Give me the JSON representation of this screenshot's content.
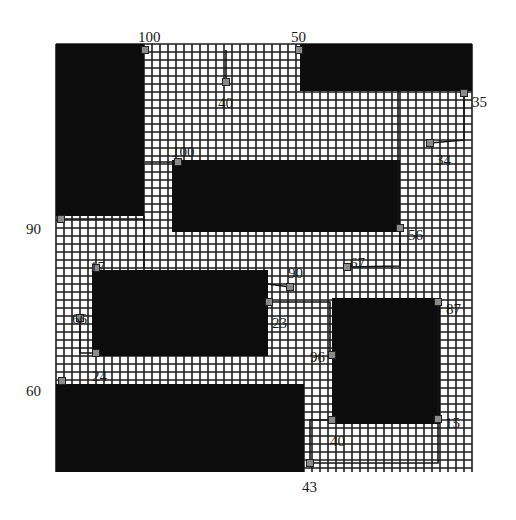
{
  "board": {
    "x": 56,
    "y": 44,
    "width": 416,
    "height": 428,
    "pitch": 8,
    "grid_color": "#1c1c1c",
    "background": "#ffffff",
    "block_color": "#0c0c0c"
  },
  "blocks": [
    {
      "id": "block-top-left",
      "x": 56,
      "y": 44,
      "w": 88,
      "h": 172
    },
    {
      "id": "block-top-right",
      "x": 300,
      "y": 44,
      "w": 172,
      "h": 47
    },
    {
      "id": "block-center",
      "x": 172,
      "y": 160,
      "w": 228,
      "h": 72
    },
    {
      "id": "block-mid-left",
      "x": 92,
      "y": 270,
      "w": 176,
      "h": 86
    },
    {
      "id": "block-right",
      "x": 332,
      "y": 298,
      "w": 108,
      "h": 126
    },
    {
      "id": "block-bottom-left",
      "x": 56,
      "y": 384,
      "w": 248,
      "h": 88
    }
  ],
  "pins": [
    {
      "id": "pin-100-top",
      "x": 145,
      "y": 50,
      "label": "100",
      "lx": 138,
      "ly": 42
    },
    {
      "id": "pin-50",
      "x": 299,
      "y": 50,
      "label": "50",
      "lx": 291,
      "ly": 42
    },
    {
      "id": "pin-40-top",
      "x": 226,
      "y": 82,
      "label": "40",
      "lx": 218,
      "ly": 108
    },
    {
      "id": "pin-35",
      "x": 464,
      "y": 93,
      "label": "35",
      "lx": 472,
      "ly": 107
    },
    {
      "id": "pin-34",
      "x": 430,
      "y": 143,
      "label": "34",
      "lx": 436,
      "ly": 165
    },
    {
      "id": "pin-100-mid",
      "x": 178,
      "y": 162,
      "label": "100",
      "lx": 172,
      "ly": 157
    },
    {
      "id": "pin-90-left",
      "x": 61,
      "y": 219,
      "label": "90",
      "lx": 26,
      "ly": 234
    },
    {
      "id": "pin-56",
      "x": 400,
      "y": 228,
      "label": "56",
      "lx": 408,
      "ly": 240
    },
    {
      "id": "pin-67",
      "x": 347,
      "y": 267,
      "label": "67",
      "lx": 350,
      "ly": 268
    },
    {
      "id": "pin-17",
      "x": 96,
      "y": 268,
      "label": "17",
      "lx": 90,
      "ly": 272
    },
    {
      "id": "pin-90-mid",
      "x": 290,
      "y": 287,
      "label": "90",
      "lx": 288,
      "ly": 278
    },
    {
      "id": "pin-23",
      "x": 269,
      "y": 302,
      "label": "23",
      "lx": 272,
      "ly": 328
    },
    {
      "id": "pin-87",
      "x": 438,
      "y": 302,
      "label": "87",
      "lx": 446,
      "ly": 314
    },
    {
      "id": "pin-66",
      "x": 80,
      "y": 318,
      "label": "66",
      "lx": 72,
      "ly": 324
    },
    {
      "id": "pin-96",
      "x": 332,
      "y": 355,
      "label": "96",
      "lx": 310,
      "ly": 362
    },
    {
      "id": "pin-24",
      "x": 96,
      "y": 353,
      "label": "24",
      "lx": 92,
      "ly": 381
    },
    {
      "id": "pin-60",
      "x": 62,
      "y": 381,
      "label": "60",
      "lx": 26,
      "ly": 396
    },
    {
      "id": "pin-15",
      "x": 438,
      "y": 419,
      "label": "15",
      "lx": 445,
      "ly": 428
    },
    {
      "id": "pin-40-bottom",
      "x": 332,
      "y": 420,
      "label": "40",
      "lx": 330,
      "ly": 446
    },
    {
      "id": "pin-43",
      "x": 310,
      "y": 463,
      "label": "43",
      "lx": 302,
      "ly": 492
    }
  ],
  "wires": [
    {
      "id": "wire-40-top",
      "points": [
        [
          226,
          50
        ],
        [
          226,
          82
        ]
      ]
    },
    {
      "id": "wire-35-34",
      "points": [
        [
          464,
          93
        ],
        [
          464,
          140
        ],
        [
          430,
          143
        ]
      ]
    },
    {
      "id": "wire-100-mid",
      "points": [
        [
          145,
          162
        ],
        [
          178,
          162
        ]
      ]
    },
    {
      "id": "wire-90-left",
      "points": [
        [
          61,
          219
        ],
        [
          144,
          219
        ]
      ]
    },
    {
      "id": "wire-vertical-center",
      "points": [
        [
          398,
          91
        ],
        [
          398,
          228
        ]
      ]
    },
    {
      "id": "wire-56-67",
      "points": [
        [
          400,
          228
        ],
        [
          400,
          266
        ],
        [
          347,
          267
        ]
      ]
    },
    {
      "id": "wire-17-col",
      "points": [
        [
          144,
          216
        ],
        [
          144,
          268
        ]
      ]
    },
    {
      "id": "wire-90-mid",
      "points": [
        [
          268,
          284
        ],
        [
          290,
          287
        ]
      ]
    },
    {
      "id": "wire-23-96",
      "points": [
        [
          269,
          302
        ],
        [
          330,
          302
        ],
        [
          330,
          355
        ]
      ]
    },
    {
      "id": "wire-66-24",
      "points": [
        [
          80,
          318
        ],
        [
          80,
          353
        ],
        [
          96,
          353
        ]
      ]
    },
    {
      "id": "wire-87-15",
      "points": [
        [
          438,
          302
        ],
        [
          438,
          419
        ]
      ]
    },
    {
      "id": "wire-40-43",
      "points": [
        [
          332,
          420
        ],
        [
          310,
          420
        ],
        [
          310,
          463
        ]
      ]
    },
    {
      "id": "wire-15-bottom",
      "points": [
        [
          438,
          419
        ],
        [
          438,
          463
        ],
        [
          310,
          463
        ]
      ]
    }
  ]
}
